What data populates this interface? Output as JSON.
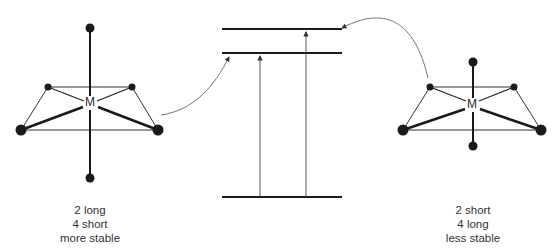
{
  "diagram": {
    "type": "octahedral distortion energy diagram",
    "left_complex": {
      "center_label": "M",
      "caption": [
        "2 long",
        "4 short",
        "more stable"
      ]
    },
    "right_complex": {
      "center_label": "M",
      "caption": [
        "2 short",
        "4 long",
        "less stable"
      ]
    },
    "energy_levels": {
      "count": 3,
      "transitions": 2
    },
    "colors": {
      "line": "#1a1a1a",
      "thin_line": "#555555",
      "text": "#333333"
    }
  }
}
